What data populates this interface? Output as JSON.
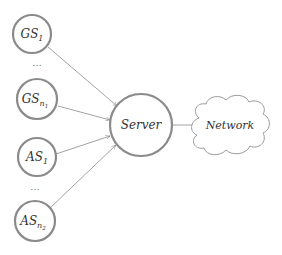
{
  "diagram": {
    "type": "network-topology",
    "nodes": {
      "gs1": {
        "base": "GS",
        "sub": "1"
      },
      "gsn1": {
        "base": "GS",
        "sub": "n",
        "subsub": "1"
      },
      "as1": {
        "base": "AS",
        "sub": "1"
      },
      "asn2": {
        "base": "AS",
        "sub": "n",
        "subsub": "2"
      },
      "server": {
        "label": "Server"
      },
      "network": {
        "label": "Network"
      }
    },
    "ellipsis_top": "...",
    "ellipsis_bottom": "...",
    "edges": [
      {
        "from": "GS_1",
        "to": "Server"
      },
      {
        "from": "GS_n1",
        "to": "Server"
      },
      {
        "from": "AS_1",
        "to": "Server"
      },
      {
        "from": "AS_n2",
        "to": "Server"
      },
      {
        "from": "Server",
        "to": "Network"
      }
    ],
    "colors": {
      "node_stroke": "#8a8a8a",
      "edge": "#8c8c8c",
      "text": "#333333"
    }
  }
}
